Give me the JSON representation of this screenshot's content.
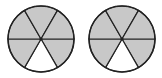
{
  "diagram": {
    "type": "fraction-circles",
    "circles": [
      {
        "id": "circle-1",
        "cx": 41,
        "cy": 39,
        "r": 33,
        "sectors": 6,
        "shaded": 5,
        "unshaded_positions": [
          "bottom"
        ]
      },
      {
        "id": "circle-2",
        "cx": 122,
        "cy": 39,
        "r": 33,
        "sectors": 6,
        "shaded": 5,
        "unshaded_positions": [
          "bottom"
        ]
      }
    ],
    "colors": {
      "shade": "#c8c8c8",
      "stroke": "#222222",
      "background": "#ffffff"
    }
  }
}
